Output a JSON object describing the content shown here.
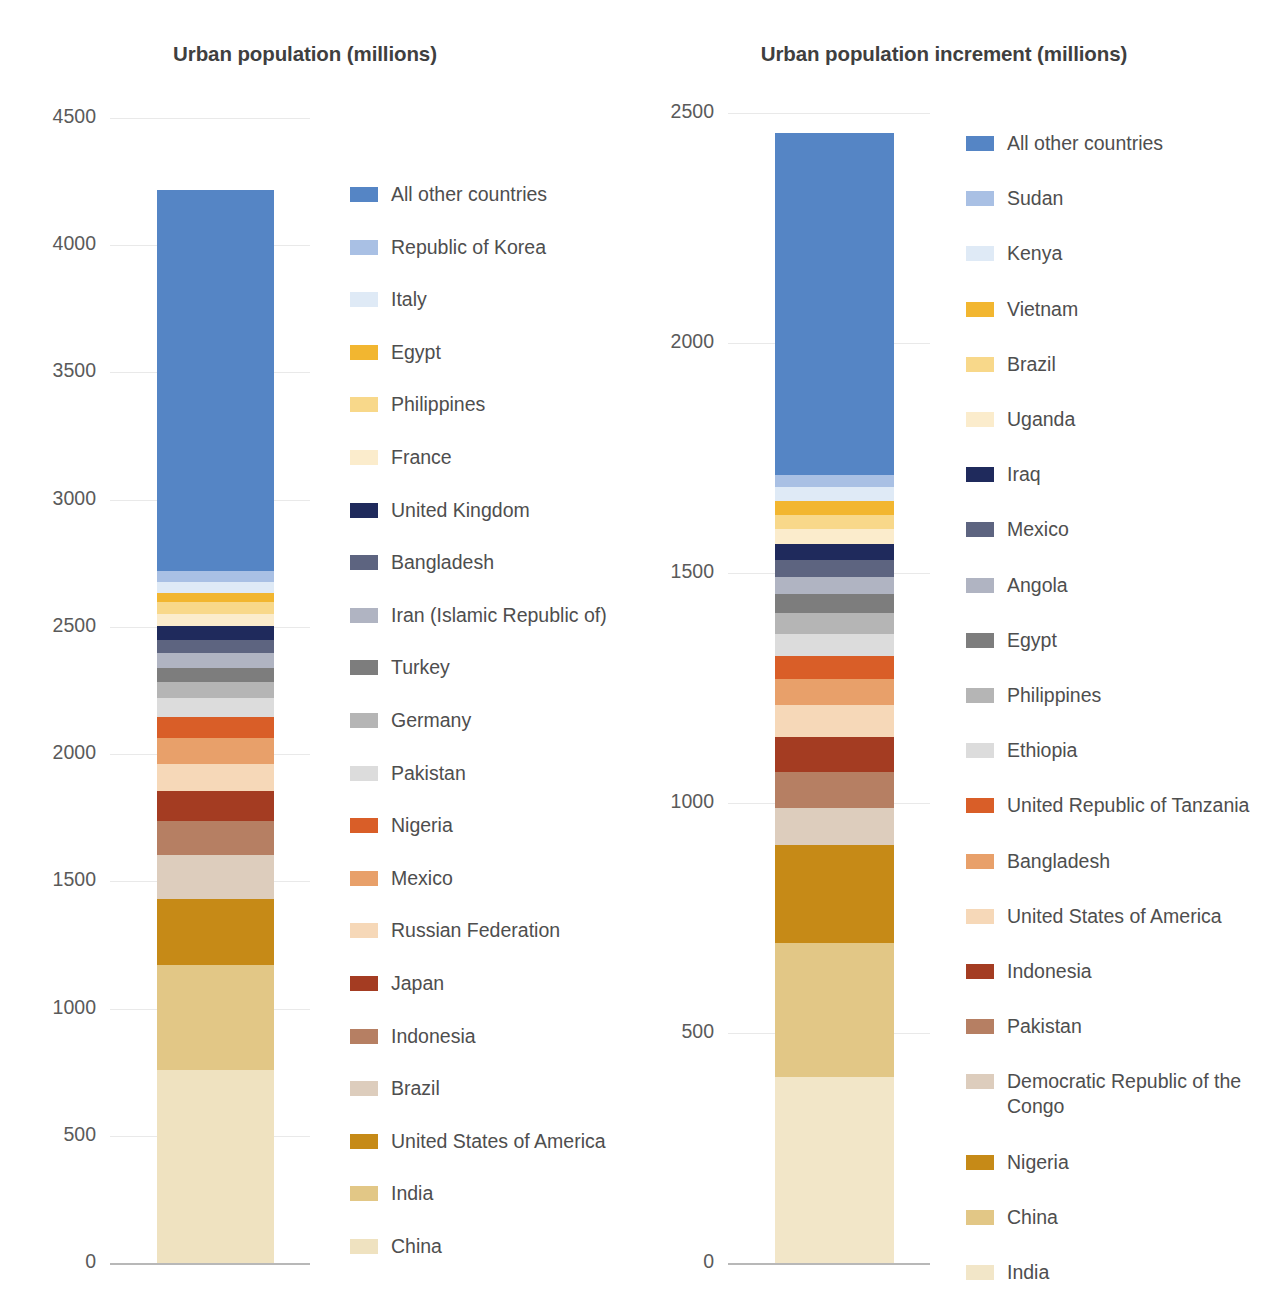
{
  "chart_data": [
    {
      "type": "bar",
      "title": "Urban population (millions)",
      "xlabel": "",
      "ylabel": "",
      "ylim": [
        0,
        4500
      ],
      "yticks": [
        0,
        500,
        1000,
        1500,
        2000,
        2500,
        3000,
        3500,
        4000,
        4500
      ],
      "ytick_labels": [
        "0",
        "500",
        "1000",
        "1500",
        "2000",
        "2500",
        "3000",
        "3500",
        "4000",
        "4500"
      ],
      "grid": true,
      "legend_position": "right",
      "stacked": true,
      "categories": [
        "2014"
      ],
      "total": 4219,
      "series": [
        {
          "name": "China",
          "value": 758,
          "color": "#efe2c0"
        },
        {
          "name": "India",
          "value": 412,
          "color": "#e2c786"
        },
        {
          "name": "United States of America",
          "value": 261,
          "color": "#c68a17"
        },
        {
          "name": "Brazil",
          "value": 173,
          "color": "#ddcdbd"
        },
        {
          "name": "Indonesia",
          "value": 134,
          "color": "#b67f63"
        },
        {
          "name": "Japan",
          "value": 118,
          "color": "#a43c22"
        },
        {
          "name": "Russian Federation",
          "value": 106,
          "color": "#f6d8b8"
        },
        {
          "name": "Mexico",
          "value": 100,
          "color": "#e8a06a"
        },
        {
          "name": "Nigeria",
          "value": 85,
          "color": "#d95e28"
        },
        {
          "name": "Pakistan",
          "value": 73,
          "color": "#dcdcdc"
        },
        {
          "name": "Germany",
          "value": 62,
          "color": "#b5b5b5"
        },
        {
          "name": "Turkey",
          "value": 58,
          "color": "#7d7d7d"
        },
        {
          "name": "Iran (Islamic Republic of)",
          "value": 56,
          "color": "#b0b4c2"
        },
        {
          "name": "Bangladesh",
          "value": 54,
          "color": "#5d6480"
        },
        {
          "name": "United Kingdom",
          "value": 52,
          "color": "#1f2a5c"
        },
        {
          "name": "France",
          "value": 50,
          "color": "#fbeccc"
        },
        {
          "name": "Philippines",
          "value": 45,
          "color": "#f8d88a"
        },
        {
          "name": "Egypt",
          "value": 38,
          "color": "#f2b630"
        },
        {
          "name": "Italy",
          "value": 41,
          "color": "#dfeaf6"
        },
        {
          "name": "Republic of Korea",
          "value": 42,
          "color": "#a9c0e4"
        },
        {
          "name": "All other countries",
          "value": 1501,
          "color": "#5585c5"
        }
      ]
    },
    {
      "type": "bar",
      "title": "Urban population increment (millions)",
      "xlabel": "",
      "ylabel": "",
      "ylim": [
        0,
        2500
      ],
      "yticks": [
        0,
        500,
        1000,
        1500,
        2000,
        2500
      ],
      "ytick_labels": [
        "0",
        "500",
        "1000",
        "1500",
        "2000",
        "2500"
      ],
      "grid": true,
      "legend_position": "right",
      "stacked": true,
      "categories": [
        "2014-2050"
      ],
      "total": 2456,
      "series": [
        {
          "name": "India",
          "value": 404,
          "color": "#f2e6c8"
        },
        {
          "name": "China",
          "value": 292,
          "color": "#e2c786"
        },
        {
          "name": "Nigeria",
          "value": 212,
          "color": "#c68a17"
        },
        {
          "name": "Democratic Republic of the\nCongo",
          "value": 82,
          "color": "#ddcdbd"
        },
        {
          "name": "Pakistan",
          "value": 78,
          "color": "#b67f63"
        },
        {
          "name": "Indonesia",
          "value": 75,
          "color": "#a43c22"
        },
        {
          "name": "United States of America",
          "value": 69,
          "color": "#f6d8b8"
        },
        {
          "name": "Bangladesh",
          "value": 57,
          "color": "#e8a06a"
        },
        {
          "name": "United Republic of Tanzania",
          "value": 51,
          "color": "#d95e28"
        },
        {
          "name": "Ethiopia",
          "value": 47,
          "color": "#dcdcdc"
        },
        {
          "name": "Philippines",
          "value": 45,
          "color": "#b5b5b5"
        },
        {
          "name": "Egypt",
          "value": 42,
          "color": "#7d7d7d"
        },
        {
          "name": "Angola",
          "value": 38,
          "color": "#b0b4c2"
        },
        {
          "name": "Mexico",
          "value": 36,
          "color": "#5d6480"
        },
        {
          "name": "Iraq",
          "value": 35,
          "color": "#1f2a5c"
        },
        {
          "name": "Uganda",
          "value": 33,
          "color": "#fbeccc"
        },
        {
          "name": "Brazil",
          "value": 31,
          "color": "#f8d88a"
        },
        {
          "name": "Vietnam",
          "value": 30,
          "color": "#f2b630"
        },
        {
          "name": "Kenya",
          "value": 29,
          "color": "#dfeaf6"
        },
        {
          "name": "Sudan",
          "value": 28,
          "color": "#a9c0e4"
        },
        {
          "name": "All other countries",
          "value": 742,
          "color": "#5585c5"
        }
      ]
    }
  ]
}
